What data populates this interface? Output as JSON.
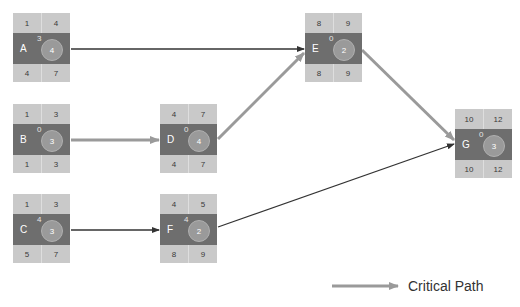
{
  "diagram": {
    "type": "network-diagram-critical-path",
    "colors": {
      "node_top_bottom": "#c9c9c9",
      "node_middle": "#6e6e6e",
      "duration_circle": "#9a9a9a",
      "critical_arrow": "#9a9a9a",
      "normal_arrow": "#333333"
    },
    "nodes": [
      {
        "id": "A",
        "es": "1",
        "ef": "4",
        "slack": "3",
        "duration": "4",
        "ls": "4",
        "lf": "7"
      },
      {
        "id": "B",
        "es": "1",
        "ef": "3",
        "slack": "0",
        "duration": "3",
        "ls": "1",
        "lf": "3"
      },
      {
        "id": "C",
        "es": "1",
        "ef": "3",
        "slack": "4",
        "duration": "3",
        "ls": "5",
        "lf": "7"
      },
      {
        "id": "D",
        "es": "4",
        "ef": "7",
        "slack": "0",
        "duration": "4",
        "ls": "4",
        "lf": "7"
      },
      {
        "id": "E",
        "es": "8",
        "ef": "9",
        "slack": "0",
        "duration": "2",
        "ls": "8",
        "lf": "9"
      },
      {
        "id": "F",
        "es": "4",
        "ef": "5",
        "slack": "4",
        "duration": "2",
        "ls": "8",
        "lf": "9"
      },
      {
        "id": "G",
        "es": "10",
        "ef": "12",
        "slack": "0",
        "duration": "3",
        "ls": "10",
        "lf": "12"
      }
    ],
    "edges": [
      {
        "from": "A",
        "to": "E",
        "critical": false
      },
      {
        "from": "B",
        "to": "D",
        "critical": true
      },
      {
        "from": "D",
        "to": "E",
        "critical": true
      },
      {
        "from": "E",
        "to": "G",
        "critical": true
      },
      {
        "from": "C",
        "to": "F",
        "critical": false
      },
      {
        "from": "F",
        "to": "G",
        "critical": false
      }
    ]
  },
  "legend": {
    "label": "Critical Path"
  }
}
